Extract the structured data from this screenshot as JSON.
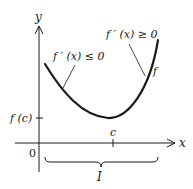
{
  "figure": {
    "type": "function graph",
    "axes": {
      "x_label": "x",
      "y_label": "y",
      "origin_label": "0"
    },
    "ticks": {
      "y_tick_label": "f (c)",
      "x_tick_label": "c"
    },
    "curve": {
      "label": "f",
      "shape": "convex, minimum at x = c"
    },
    "annotations": {
      "left": "f ′ (x) ≤ 0",
      "right": "f ′ (x) ≥ 0"
    },
    "interval": {
      "label": "I"
    },
    "colors": {
      "stroke": "#1a1a1a",
      "background": "#ffffff"
    }
  }
}
